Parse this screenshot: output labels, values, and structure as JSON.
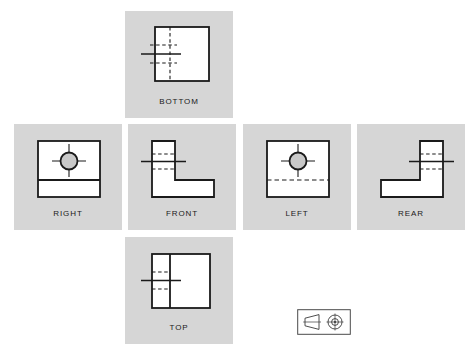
{
  "figure": {
    "background_color": "#ffffff",
    "panel_color": "#d6d6d6",
    "part_fill_color": "#ffffff",
    "line_color": "#1a1a1a",
    "circle_fill_color": "#c9c9c9"
  },
  "views": {
    "bottom": {
      "label": "BOTTOM",
      "panel": {
        "x": 125,
        "y": 11,
        "w": 108,
        "h": 107
      },
      "outline": "square",
      "has_circle": false,
      "hidden_lines": "vertical-dashed-and-two-horizontal-dashed",
      "center_mark": true
    },
    "right": {
      "label": "RIGHT",
      "panel": {
        "x": 14,
        "y": 124,
        "w": 108,
        "h": 106
      },
      "outline": "square",
      "has_circle": true,
      "hidden_lines": "solid-horizontal-divider-near-bottom",
      "center_mark": true
    },
    "front": {
      "label": "FRONT",
      "panel": {
        "x": 128,
        "y": 124,
        "w": 108,
        "h": 106
      },
      "outline": "L-shape-left-upright",
      "has_circle": false,
      "hidden_lines": "two-horizontal-dashed",
      "center_mark": true
    },
    "left": {
      "label": "LEFT",
      "panel": {
        "x": 243,
        "y": 124,
        "w": 108,
        "h": 106
      },
      "outline": "square",
      "has_circle": true,
      "hidden_lines": "dashed-horizontal-divider-near-bottom",
      "center_mark": true
    },
    "rear": {
      "label": "REAR",
      "panel": {
        "x": 357,
        "y": 124,
        "w": 108,
        "h": 106
      },
      "outline": "L-shape-right-upright",
      "has_circle": false,
      "hidden_lines": "two-horizontal-dashed",
      "center_mark": true
    },
    "top": {
      "label": "TOP",
      "panel": {
        "x": 125,
        "y": 237,
        "w": 108,
        "h": 107
      },
      "outline": "square",
      "has_circle": false,
      "hidden_lines": "solid-vertical-divider-and-two-horizontal-dashed",
      "center_mark": true
    }
  },
  "projection_symbol": {
    "name": "first-angle-projection-symbol",
    "box": {
      "x": 297,
      "y": 309,
      "w": 54,
      "h": 26
    },
    "left_glyph": "truncated-cone-side-view",
    "right_glyph": "concentric-circles-with-crosshair"
  }
}
